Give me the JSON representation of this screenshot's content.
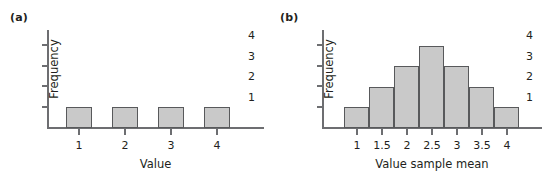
{
  "figure": {
    "background": "#ffffff",
    "bar_fill": "#c9c9c9",
    "bar_stroke": "#58595b",
    "axis_color": "#6d6e71",
    "text_color": "#231f20"
  },
  "panels": [
    {
      "label": "(a)",
      "chart_data": {
        "type": "bar",
        "title": "",
        "xlabel": "Value",
        "ylabel": "Frequency",
        "categories": [
          "1",
          "2",
          "3",
          "4"
        ],
        "values": [
          1,
          1,
          1,
          1
        ],
        "ylim": [
          0,
          4.6
        ],
        "yticks": [
          "1",
          "2",
          "3",
          "4"
        ],
        "ytick_values": [
          1,
          2,
          3,
          4
        ],
        "xticks": [
          "1",
          "2",
          "3",
          "4"
        ],
        "grid": false,
        "legend": "none",
        "bars_contiguous": false
      }
    },
    {
      "label": "(b)",
      "chart_data": {
        "type": "bar",
        "title": "",
        "xlabel": "Value sample mean",
        "ylabel": "Frequency",
        "categories": [
          "1",
          "1.5",
          "2",
          "2.5",
          "3",
          "3.5",
          "4"
        ],
        "values": [
          1,
          2,
          3,
          4,
          3,
          2,
          1
        ],
        "ylim": [
          0,
          4.6
        ],
        "yticks": [
          "1",
          "2",
          "3",
          "4"
        ],
        "ytick_values": [
          1,
          2,
          3,
          4
        ],
        "xticks": [
          "1",
          "1.5",
          "2",
          "2.5",
          "3",
          "3.5",
          "4"
        ],
        "grid": false,
        "legend": "none",
        "bars_contiguous": true
      }
    }
  ]
}
